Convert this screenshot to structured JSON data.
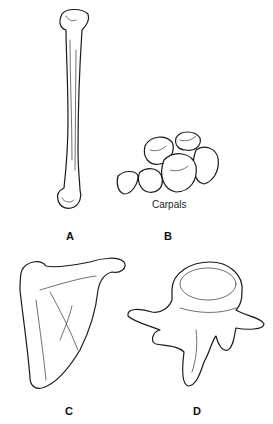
{
  "figure": {
    "panels": [
      {
        "id": "A",
        "label": "A",
        "depiction": "humerus (long bone)"
      },
      {
        "id": "B",
        "label": "B",
        "caption": "Carpals",
        "depiction": "carpal bones cluster"
      },
      {
        "id": "C",
        "label": "C",
        "depiction": "scapula"
      },
      {
        "id": "D",
        "label": "D",
        "depiction": "vertebra"
      }
    ]
  }
}
